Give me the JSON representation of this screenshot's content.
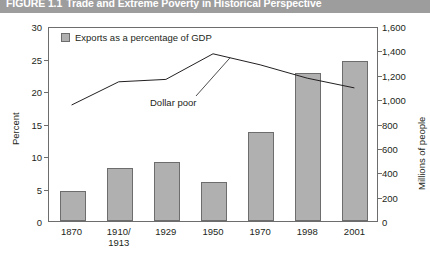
{
  "figure": {
    "number": "FIGURE 1.1",
    "title": "Trade and Extreme Poverty in Historical Perspective"
  },
  "legend": {
    "bar_series_label": "Exports as a percentage of GDP",
    "swatch_color": "#b0b0b0"
  },
  "annotation": {
    "line_series_label": "Dollar poor"
  },
  "axes": {
    "left": {
      "label": "Percent",
      "ticks": [
        "0",
        "5",
        "10",
        "15",
        "20",
        "25",
        "30"
      ]
    },
    "right": {
      "label": "Millions of people",
      "ticks": [
        "0",
        "200",
        "400",
        "600",
        "800",
        "1,000",
        "1,200",
        "1,400",
        "1,600"
      ]
    },
    "categories": [
      "1870",
      "1910/\n1913",
      "1929",
      "1950",
      "1970",
      "1998",
      "2001"
    ]
  },
  "chart_data": {
    "type": "bar",
    "title": "Trade and Extreme Poverty in Historical Perspective",
    "xlabel": "",
    "ylabel": "Percent",
    "y2label": "Millions of people",
    "ylim": [
      0,
      30
    ],
    "y2lim": [
      0,
      1600
    ],
    "grid": false,
    "legend_position": "top-left",
    "categories": [
      "1870",
      "1910/1913",
      "1929",
      "1950",
      "1970",
      "1998",
      "2001"
    ],
    "series": [
      {
        "name": "Exports as a percentage of GDP",
        "type": "bar",
        "axis": "left",
        "unit": "percent",
        "values": [
          4.6,
          8.2,
          9.1,
          6.0,
          13.7,
          22.8,
          24.6
        ]
      },
      {
        "name": "Dollar poor",
        "type": "line",
        "axis": "right",
        "unit": "millions of people",
        "values": [
          960,
          1150,
          1170,
          1380,
          1290,
          1180,
          1100
        ]
      }
    ]
  }
}
